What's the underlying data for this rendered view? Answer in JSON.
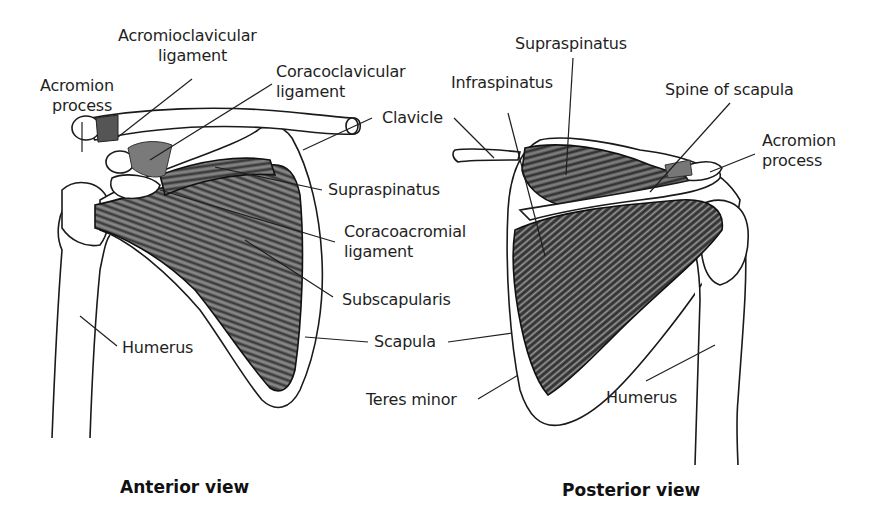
{
  "figure": {
    "type": "anatomical-diagram"
  },
  "anterior": {
    "caption": "Anterior view",
    "labels": {
      "acromion_process": [
        "Acromion",
        "process"
      ],
      "acromioclavicular_ligament": [
        "Acromioclavicular",
        "ligament"
      ],
      "coracoclavicular_ligament": [
        "Coracoclavicular",
        "ligament"
      ],
      "clavicle": "Clavicle",
      "supraspinatus": "Supraspinatus",
      "coracoacromial_ligament": [
        "Coracoacromial",
        "ligament"
      ],
      "subscapularis": "Subscapularis",
      "humerus": "Humerus"
    }
  },
  "shared": {
    "scapula": "Scapula"
  },
  "posterior": {
    "caption": "Posterior view",
    "labels": {
      "supraspinatus": "Supraspinatus",
      "infraspinatus": "Infraspinatus",
      "spine_of_scapula": "Spine of scapula",
      "acromion_process": [
        "Acromion",
        "process"
      ],
      "teres_minor": "Teres minor",
      "humerus": "Humerus"
    }
  },
  "colors": {
    "ink": "#1f1f1f",
    "muscle": "#4a4a4a",
    "muscle_light": "#8a8a8a",
    "bone": "#ffffff",
    "background": "#ffffff"
  }
}
